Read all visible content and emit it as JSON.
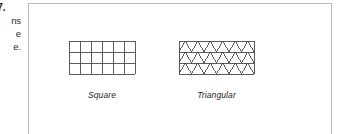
{
  "margin": {
    "question_number": "7.",
    "line1": "ns",
    "line2": "e",
    "line3": "e."
  },
  "panel": {
    "border_color": "#b9b9b9",
    "background": "#ffffff"
  },
  "figures": [
    {
      "name": "square-grid",
      "label": "Square",
      "grid": {
        "type": "square",
        "columns": 6,
        "rows": 3,
        "cell_width": 11,
        "cell_height": 11,
        "stroke": "#4a4a4a",
        "stroke_width": 0.9
      }
    },
    {
      "name": "triangular-grid",
      "label": "Triangular",
      "grid": {
        "type": "triangular",
        "columns": 6,
        "rows": 3,
        "cell_width": 12.5,
        "cell_height": 11,
        "stroke": "#4a4a4a",
        "stroke_width": 0.9
      }
    }
  ]
}
